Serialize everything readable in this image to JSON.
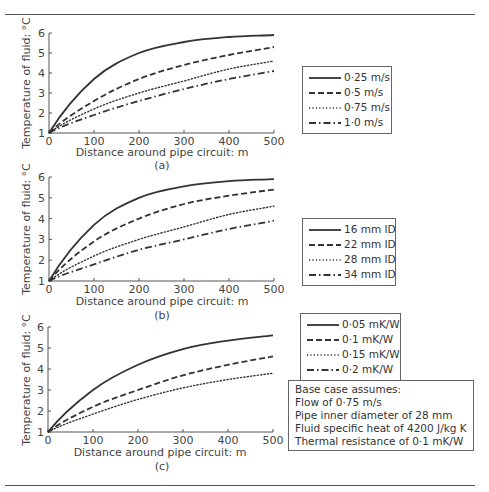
{
  "chart_data": [
    {
      "type": "line",
      "panel_label": "(a)",
      "title": "",
      "xlabel": "Distance around pipe circuit: m",
      "ylabel": "Temperature of fluid: °C",
      "xlim": [
        0,
        500
      ],
      "ylim": [
        1,
        6
      ],
      "x_ticks": [
        "0",
        "100",
        "200",
        "300",
        "400",
        "500"
      ],
      "y_ticks": [
        "1",
        "2",
        "3",
        "4",
        "5",
        "6"
      ],
      "grid": false,
      "legend_position": "right",
      "x": [
        0,
        100,
        200,
        300,
        400,
        500
      ],
      "series": [
        {
          "name": "0·25 m/s",
          "style": "solid",
          "values": [
            1.0,
            3.7,
            5.0,
            5.55,
            5.8,
            5.9
          ]
        },
        {
          "name": "0·5 m/s",
          "style": "dashed",
          "values": [
            1.0,
            2.6,
            3.7,
            4.4,
            4.9,
            5.3
          ]
        },
        {
          "name": "0·75 m/s",
          "style": "dotted",
          "values": [
            1.0,
            2.2,
            3.0,
            3.6,
            4.2,
            4.6
          ]
        },
        {
          "name": "1·0 m/s",
          "style": "dash-dot",
          "values": [
            1.0,
            1.9,
            2.6,
            3.2,
            3.7,
            4.1
          ]
        }
      ]
    },
    {
      "type": "line",
      "panel_label": "(b)",
      "title": "",
      "xlabel": "Distance around pipe circuit: m",
      "ylabel": "Temperature of fluid: °C",
      "xlim": [
        0,
        500
      ],
      "ylim": [
        1,
        6
      ],
      "x_ticks": [
        "0",
        "100",
        "200",
        "300",
        "400",
        "500"
      ],
      "y_ticks": [
        "1",
        "2",
        "3",
        "4",
        "5",
        "6"
      ],
      "grid": false,
      "legend_position": "right",
      "x": [
        0,
        100,
        200,
        300,
        400,
        500
      ],
      "series": [
        {
          "name": "16 mm ID",
          "style": "solid",
          "values": [
            1.0,
            3.7,
            5.0,
            5.55,
            5.8,
            5.9
          ]
        },
        {
          "name": "22 mm ID",
          "style": "dashed",
          "values": [
            1.0,
            2.9,
            4.0,
            4.7,
            5.1,
            5.4
          ]
        },
        {
          "name": "28 mm ID",
          "style": "dotted",
          "values": [
            1.0,
            2.2,
            3.0,
            3.6,
            4.2,
            4.6
          ]
        },
        {
          "name": "34 mm ID",
          "style": "dash-dot",
          "values": [
            1.0,
            1.8,
            2.5,
            3.0,
            3.5,
            3.9
          ]
        }
      ]
    },
    {
      "type": "line",
      "panel_label": "(c)",
      "title": "",
      "xlabel": "Distance around pipe circuit: m",
      "ylabel": "Temperature of fluid: °C",
      "xlim": [
        0,
        500
      ],
      "ylim": [
        1,
        6
      ],
      "x_ticks": [
        "0",
        "100",
        "200",
        "300",
        "400",
        "500"
      ],
      "y_ticks": [
        "1",
        "2",
        "3",
        "4",
        "5",
        "6"
      ],
      "grid": false,
      "legend_position": "right",
      "x": [
        0,
        100,
        200,
        300,
        400,
        500
      ],
      "series": [
        {
          "name": "0·05 mK/W",
          "style": "solid",
          "values": [
            1.0,
            3.0,
            4.2,
            4.95,
            5.35,
            5.6
          ]
        },
        {
          "name": "0·1 mK/W",
          "style": "dashed",
          "values": [
            1.0,
            2.2,
            3.0,
            3.7,
            4.2,
            4.6
          ]
        },
        {
          "name": "0·15 mK/W",
          "style": "dotted",
          "values": [
            1.0,
            1.85,
            2.55,
            3.1,
            3.5,
            3.8
          ]
        },
        {
          "name": "0·2 mK/W",
          "style": "dash-dot",
          "values": []
        }
      ]
    }
  ],
  "panels": {
    "a": {
      "label": "(a)",
      "xlabel": "Distance around pipe circuit: m",
      "ylabel": "Temperature of fluid: °C",
      "legend": [
        "0·25 m/s",
        "0·5 m/s",
        "0·75 m/s",
        "1·0 m/s"
      ]
    },
    "b": {
      "label": "(b)",
      "xlabel": "Distance around pipe circuit: m",
      "ylabel": "Temperature of fluid: °C",
      "legend": [
        "16 mm ID",
        "22 mm ID",
        "28 mm ID",
        "34 mm ID"
      ]
    },
    "c": {
      "label": "(c)",
      "xlabel": "Distance around pipe circuit: m",
      "ylabel": "Temperature of fluid: °C",
      "legend": [
        "0·05 mK/W",
        "0·1 mK/W",
        "0·15 mK/W",
        "0·2 mK/W"
      ]
    }
  },
  "x_ticks": [
    "0",
    "100",
    "200",
    "300",
    "400",
    "500"
  ],
  "y_ticks": [
    "1",
    "2",
    "3",
    "4",
    "5",
    "6"
  ],
  "base_case": {
    "title": "Base case assumes:",
    "lines": [
      "Flow of 0·75 m/s",
      "Pipe inner diameter of 28 mm",
      "Fluid specific heat of 4200 J/kg K",
      "Thermal resistance of 0·1 mK/W"
    ]
  },
  "colors": {
    "line": "#333333",
    "axis": "#555555",
    "text": "#444444"
  }
}
